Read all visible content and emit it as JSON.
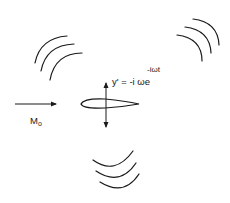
{
  "diagram": {
    "title": "",
    "labels": {
      "motion_equation_base": "y' = -i ωe",
      "motion_equation_exponent": "-iωt",
      "freestream_symbol": "M",
      "freestream_subscript": "o"
    },
    "elements": [
      {
        "id": "airfoil",
        "type": "airfoil",
        "description": "airfoil cross-section oscillating vertically"
      },
      {
        "id": "plunge-arrow",
        "type": "double-arrow",
        "direction": "vertical"
      },
      {
        "id": "freestream-arrow",
        "type": "arrow",
        "direction": "right"
      },
      {
        "id": "wave-upper-left",
        "type": "acoustic-wavefronts",
        "count": 3
      },
      {
        "id": "wave-upper-right",
        "type": "acoustic-wavefronts",
        "count": 3
      },
      {
        "id": "wave-lower",
        "type": "acoustic-wavefronts",
        "count": 3
      }
    ],
    "colors": {
      "stroke": "#1a1a1a",
      "background": "#ffffff"
    }
  }
}
